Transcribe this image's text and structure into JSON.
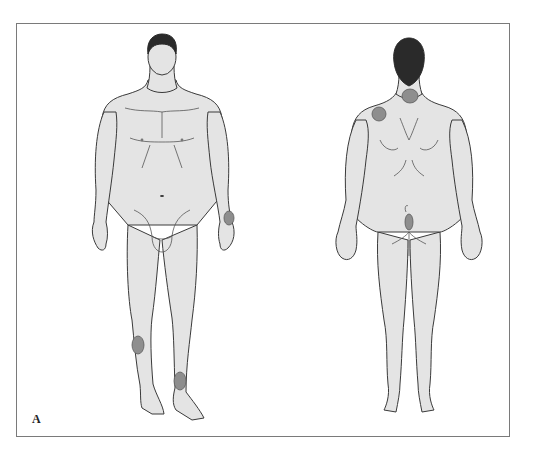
{
  "figure": {
    "panel_label": "A",
    "views": [
      {
        "name": "anterior",
        "label": "Front view"
      },
      {
        "name": "posterior",
        "label": "Back view"
      }
    ],
    "colors": {
      "skin": "#e4e4e4",
      "outline": "#3a3a3a",
      "hair": "#2a2a2a",
      "lesion_fill": "#8e8e8e",
      "lesion_stroke": "#5a5a5a",
      "frame": "#7a7a7a"
    },
    "lesions": [
      {
        "view": "anterior",
        "site": "left wrist",
        "cx": 229,
        "cy": 218,
        "rx": 5,
        "ry": 7
      },
      {
        "view": "anterior",
        "site": "right shin",
        "cx": 138,
        "cy": 345,
        "rx": 6,
        "ry": 9
      },
      {
        "view": "anterior",
        "site": "left distal leg",
        "cx": 180,
        "cy": 381,
        "rx": 6,
        "ry": 9
      },
      {
        "view": "posterior",
        "site": "nape of neck",
        "cx": 407,
        "cy": 95,
        "rx": 8,
        "ry": 7
      },
      {
        "view": "posterior",
        "site": "right scapula",
        "cx": 379,
        "cy": 114,
        "rx": 7,
        "ry": 7
      },
      {
        "view": "posterior",
        "site": "gluteal cleft",
        "cx": 409,
        "cy": 224,
        "rx": 4,
        "ry": 8
      }
    ]
  }
}
